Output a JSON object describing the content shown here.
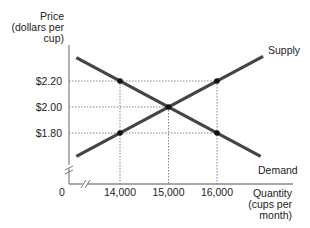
{
  "chart_data": {
    "type": "line",
    "title": "",
    "ylabel_lines": [
      "Price",
      "(dollars per",
      "cup)"
    ],
    "xlabel_lines": [
      "Quantity",
      "(cups per",
      "month)"
    ],
    "origin_label": "0",
    "x_ticks": [
      {
        "value": 14000,
        "label": "14,000"
      },
      {
        "value": 15000,
        "label": "15,000"
      },
      {
        "value": 16000,
        "label": "16,000"
      }
    ],
    "y_ticks": [
      {
        "value": 2.2,
        "label": "$2.20"
      },
      {
        "value": 2.0,
        "label": "$2.00"
      },
      {
        "value": 1.8,
        "label": "$1.80"
      }
    ],
    "axis_breaks": true,
    "series": [
      {
        "name": "Supply",
        "label": "Supply",
        "points": [
          [
            13100,
            1.62
          ],
          [
            16950,
            2.39
          ]
        ],
        "color": "#444444"
      },
      {
        "name": "Demand",
        "label": "Demand",
        "points": [
          [
            13100,
            2.38
          ],
          [
            16900,
            1.62
          ]
        ],
        "color": "#444444"
      }
    ],
    "marked_points": [
      {
        "x": 14000,
        "y": 2.2
      },
      {
        "x": 14000,
        "y": 1.8
      },
      {
        "x": 15000,
        "y": 2.0
      },
      {
        "x": 16000,
        "y": 2.2
      },
      {
        "x": 16000,
        "y": 1.8
      }
    ],
    "guide_lines": "dotted"
  }
}
